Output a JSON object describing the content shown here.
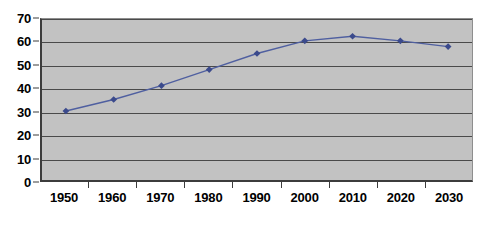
{
  "chart_data": {
    "type": "line",
    "title": "",
    "subtitle": "",
    "xlabel": "",
    "ylabel": "",
    "categories": [
      "1950",
      "1960",
      "1970",
      "1980",
      "1990",
      "2000",
      "2010",
      "2020",
      "2030"
    ],
    "values": [
      30,
      35,
      41,
      48,
      55,
      60.5,
      62.5,
      60.5,
      58
    ],
    "series": [
      {
        "name": "Series 1",
        "values": [
          30,
          35,
          41,
          48,
          55,
          60.5,
          62.5,
          60.5,
          58
        ]
      }
    ],
    "ylim": [
      0,
      70
    ],
    "ytick_step": 10,
    "yticks": [
      "70",
      "60",
      "50",
      "40",
      "30",
      "20",
      "10",
      "0"
    ],
    "ytick_values": [
      70,
      60,
      50,
      40,
      30,
      20,
      10,
      0
    ],
    "grid": true,
    "grid_axis": "y",
    "legend": false,
    "legend_position": "none",
    "marker": "diamond",
    "annotations": []
  },
  "style": {
    "plot_background": "#c2c2c2",
    "page_background": "#ffffff",
    "gridline_color": "#4a4a4a",
    "axis_color": "#3c3c3c",
    "series_color": "#4f5fa0",
    "marker_color": "#3b4a8c",
    "label_color": "#000000"
  }
}
